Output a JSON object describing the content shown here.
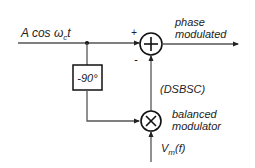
{
  "diagram": {
    "input_label": "A cos ωct",
    "input_label_main": "A cos ω",
    "input_label_sub": "c",
    "input_label_tail": "t",
    "summer": {
      "symbol": "+",
      "plus_sign": "+",
      "minus_sign": "-"
    },
    "phase_shifter": {
      "label": "-90°"
    },
    "output_label_line1": "phase",
    "output_label_line2": "modulated",
    "dsbsc_label": "(DSBSC)",
    "multiplier": {
      "symbol": "×"
    },
    "balanced_label_line1": "balanced",
    "balanced_label_line2": "modulator",
    "modulating_input_main": "V",
    "modulating_input_sub": "m",
    "modulating_input_tail": "(f)",
    "line_color": "#333333"
  }
}
